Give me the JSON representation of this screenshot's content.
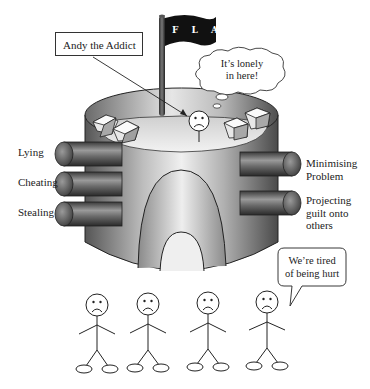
{
  "diagram": {
    "flag": {
      "text": "F L A G"
    },
    "addict": {
      "label": "Andy the Addict"
    },
    "thought_bubble": {
      "line1": "It’s lonely",
      "line2": "in here!"
    },
    "left_defenses": [
      {
        "label": "Lying"
      },
      {
        "label": "Cheating"
      },
      {
        "label": "Stealing"
      }
    ],
    "right_defenses": [
      {
        "line1": "Minimising",
        "line2": "Problem"
      },
      {
        "line1": "Projecting",
        "line2": "guilt onto",
        "line3": "others"
      }
    ],
    "speech_bubble": {
      "line1": "We’re tired",
      "line2": "of being hurt"
    },
    "people_count": 4,
    "colors": {
      "flag": "#111111",
      "cylinder_dark": "#5a5a5a",
      "cylinder_light": "#eeeeee",
      "line": "#222222"
    }
  }
}
